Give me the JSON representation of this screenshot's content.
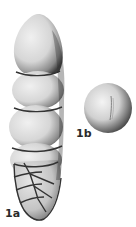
{
  "plate": {
    "background": "#ffffff",
    "figures": [
      {
        "id": "1a",
        "label": "1a",
        "description": "elongated uniserial foraminifera test, side view",
        "chambers_uniserial": 4,
        "biserial_base_rows": 4
      },
      {
        "id": "1b",
        "label": "1b",
        "description": "apertural (end) view, rounded"
      }
    ],
    "colors": {
      "light": "#e8e8e8",
      "mid": "#b5b5b5",
      "shadow": "#4a4a4a",
      "suture": "#3a3a3a"
    }
  }
}
